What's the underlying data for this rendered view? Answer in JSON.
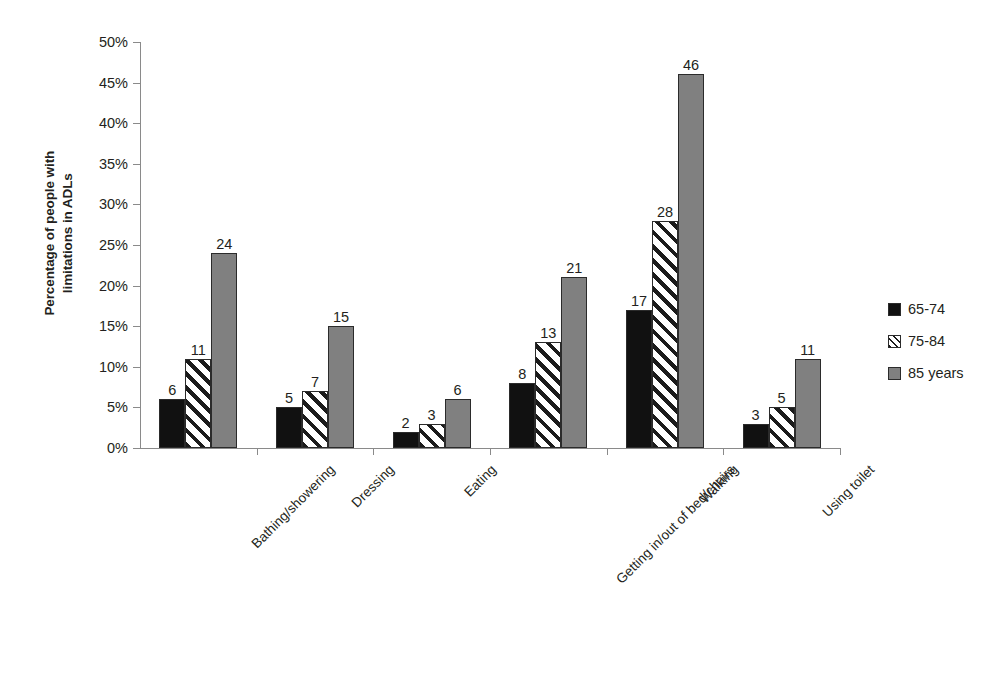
{
  "chart_data": {
    "type": "bar",
    "title": "",
    "subtitle": "",
    "xlabel": "",
    "ylabel": "Percentage of people with\nlimitations in ADLs",
    "ylim": [
      0,
      50
    ],
    "y_tick_step": 5,
    "y_tick_labels": [
      "0%",
      "5%",
      "10%",
      "15%",
      "20%",
      "25%",
      "30%",
      "35%",
      "40%",
      "45%",
      "50%"
    ],
    "y_tick_values": [
      0,
      5,
      10,
      15,
      20,
      25,
      30,
      35,
      40,
      45,
      50
    ],
    "grid": false,
    "legend_position": "right",
    "value_labels": true,
    "categories": [
      "Bathing/showering",
      "Dressing",
      "Eating",
      "Getting in/out of bed/chairs",
      "Walking",
      "Using toilet"
    ],
    "series": [
      {
        "name": "65-74",
        "fill": "solid-black",
        "color": "#111111",
        "values": [
          6,
          5,
          2,
          8,
          17,
          3
        ]
      },
      {
        "name": "75-84",
        "fill": "diagonal-hatch",
        "color": "#ffffff",
        "values": [
          11,
          7,
          3,
          13,
          28,
          5
        ]
      },
      {
        "name": "85 years",
        "fill": "solid-gray",
        "color": "#808080",
        "values": [
          24,
          15,
          6,
          21,
          46,
          11
        ]
      }
    ]
  },
  "axis": {
    "line_color": "#8a8a8a"
  }
}
